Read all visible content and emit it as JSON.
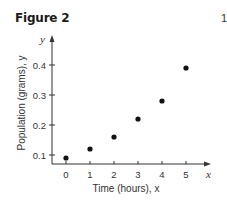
{
  "figure": {
    "title": "Figure 2",
    "corner_mark": "1"
  },
  "chart_data": {
    "type": "scatter",
    "title": "Figure 2",
    "xlabel": "Time (hours), x",
    "ylabel": "Population (grams), y",
    "x_axis_var": "x",
    "y_axis_var": "y",
    "x_ticks": [
      "0",
      "1",
      "2",
      "3",
      "4",
      "5"
    ],
    "y_ticks": [
      "0.1",
      "0.2",
      "0.3",
      "0.4"
    ],
    "xlim": [
      -0.6,
      6
    ],
    "ylim": [
      0.06,
      0.49
    ],
    "grid": false,
    "legend": null,
    "x": [
      0,
      1,
      2,
      3,
      4,
      5
    ],
    "y": [
      0.09,
      0.12,
      0.16,
      0.22,
      0.28,
      0.39
    ],
    "marker_color": "#111111"
  }
}
